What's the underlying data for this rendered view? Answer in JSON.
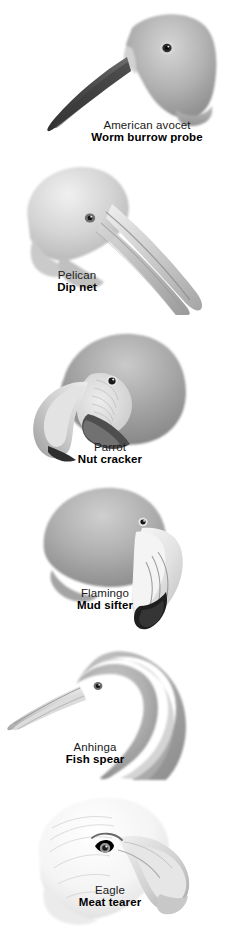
{
  "figure": {
    "background_color": "#ffffff",
    "text_color": "#000000",
    "style": "grayscale pencil illustration",
    "panel_count": 6
  },
  "panels": [
    {
      "id": "american-avocet",
      "common_name": "American avocet",
      "function": "Worm burrow probe",
      "beak_type": "long thin upcurved probing bill",
      "head_tone": "#a9a9a9",
      "beak_tone": "#5e5e5e"
    },
    {
      "id": "pelican",
      "common_name": "Pelican",
      "function": "Dip net",
      "beak_type": "very long pouched scooping bill",
      "head_tone": "#cfcfcf",
      "beak_tone": "#9a9a9a"
    },
    {
      "id": "parrot",
      "common_name": "Parrot",
      "function": "Nut cracker",
      "beak_type": "short deep hooked crushing bill",
      "head_tone": "#a6a6a6",
      "beak_tone": "#c9c9c9"
    },
    {
      "id": "flamingo",
      "common_name": "Flamingo",
      "function": "Mud sifter",
      "beak_type": "down-bent filtering bill with black tip",
      "head_tone": "#b0b0b0",
      "beak_tone": "#e8e8e8"
    },
    {
      "id": "anhinga",
      "common_name": "Anhinga",
      "function": "Fish spear",
      "beak_type": "straight sharp spearing bill",
      "head_tone": "#b5b5b5",
      "beak_tone": "#cccccc"
    },
    {
      "id": "eagle",
      "common_name": "Eagle",
      "function": "Meat tearer",
      "beak_type": "strong hooked tearing bill",
      "head_tone": "#f2f2f2",
      "beak_tone": "#d8d8d8"
    }
  ]
}
